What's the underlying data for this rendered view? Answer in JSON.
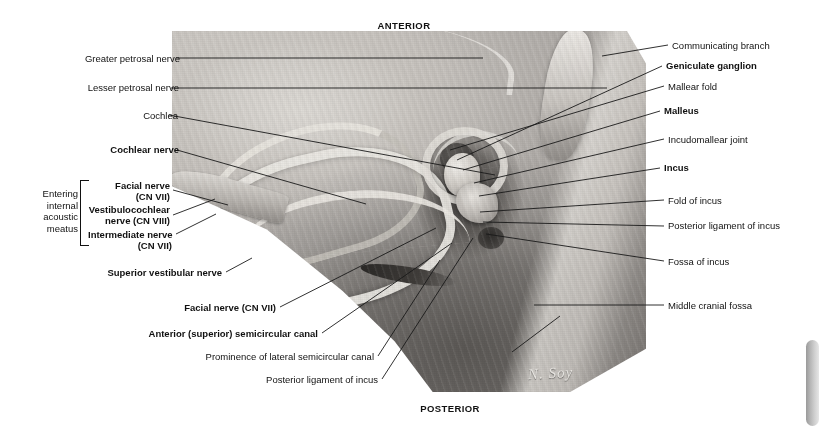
{
  "orientation": {
    "anterior": "ANTERIOR",
    "posterior": "POSTERIOR"
  },
  "figure": {
    "signature": "N. Soy",
    "group_bracket": {
      "line1": "Entering",
      "line2": "internal",
      "line3": "acoustic",
      "line4": "meatus"
    }
  },
  "labels_left": [
    {
      "id": "greater-petrosal-nerve",
      "text": "Greater petrosal nerve",
      "bold": false
    },
    {
      "id": "lesser-petrosal-nerve",
      "text": "Lesser petrosal nerve",
      "bold": false
    },
    {
      "id": "cochlea",
      "text": "Cochlea",
      "bold": false
    },
    {
      "id": "cochlear-nerve",
      "text": "Cochlear nerve",
      "bold": true
    },
    {
      "id": "facial-nerve-cn7-line1",
      "text": "Facial nerve",
      "bold": true
    },
    {
      "id": "facial-nerve-cn7-line2",
      "text": "(CN VII)",
      "bold": true
    },
    {
      "id": "vestibulocochlear-line1",
      "text": "Vestibulocochlear",
      "bold": true
    },
    {
      "id": "vestibulocochlear-line2",
      "text": "nerve (CN VIII)",
      "bold": true
    },
    {
      "id": "intermediate-nerve-line1",
      "text": "Intermediate nerve",
      "bold": true
    },
    {
      "id": "intermediate-nerve-line2",
      "text": "(CN VII)",
      "bold": true
    },
    {
      "id": "superior-vestibular-nerve",
      "text": "Superior vestibular nerve",
      "bold": true
    },
    {
      "id": "facial-nerve-cn7",
      "text": "Facial nerve (CN VII)",
      "bold": true
    },
    {
      "id": "anterior-semicircular",
      "text": "Anterior (superior) semicircular canal",
      "bold": true
    },
    {
      "id": "prominence-lateral-canal",
      "text": "Prominence of lateral semicircular canal",
      "bold": false
    },
    {
      "id": "posterior-ligament-incus-b",
      "text": "Posterior ligament of incus",
      "bold": false
    }
  ],
  "labels_right": [
    {
      "id": "communicating-branch",
      "text": "Communicating branch",
      "bold": false
    },
    {
      "id": "geniculate-ganglion",
      "text": "Geniculate ganglion",
      "bold": true
    },
    {
      "id": "mallear-fold",
      "text": "Mallear fold",
      "bold": false
    },
    {
      "id": "malleus",
      "text": "Malleus",
      "bold": true
    },
    {
      "id": "incudomallear-joint",
      "text": "Incudomallear joint",
      "bold": false
    },
    {
      "id": "incus",
      "text": "Incus",
      "bold": true
    },
    {
      "id": "fold-of-incus",
      "text": "Fold of incus",
      "bold": false
    },
    {
      "id": "posterior-ligament-incus",
      "text": "Posterior ligament of incus",
      "bold": false
    },
    {
      "id": "fossa-of-incus",
      "text": "Fossa of incus",
      "bold": false
    },
    {
      "id": "middle-cranial-fossa",
      "text": "Middle cranial fossa",
      "bold": false
    }
  ],
  "colors": {
    "background": "#ffffff",
    "text": "#111111",
    "leader_line": "#1a1a1a",
    "scrollbar": "#b4b4b4"
  }
}
